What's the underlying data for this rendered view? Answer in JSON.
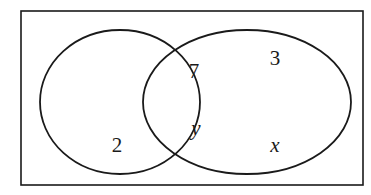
{
  "diagram": {
    "type": "venn-diagram",
    "colors": {
      "background": "#ffffff",
      "stroke": "#1a1a1a",
      "text": "#1a1a1a"
    },
    "universal_set": {
      "shape": "rectangle",
      "x": 21,
      "y": 11,
      "width": 342,
      "height": 174,
      "stroke_width": 1.6
    },
    "sets": [
      {
        "name": "left-set",
        "shape": "ellipse",
        "cx": 120,
        "cy": 102,
        "rx": 80,
        "ry": 72,
        "stroke_width": 1.8
      },
      {
        "name": "right-set",
        "shape": "ellipse",
        "cx": 247,
        "cy": 102,
        "rx": 104,
        "ry": 72,
        "stroke_width": 1.8
      }
    ],
    "intersection_points": [
      {
        "x": 196,
        "y": 38
      },
      {
        "x": 196,
        "y": 168
      }
    ],
    "labels": [
      {
        "id": "intersection-top",
        "text": "7",
        "style": "numeric",
        "region": "intersection",
        "x": 194,
        "y": 71
      },
      {
        "id": "intersection-bottom",
        "text": "y",
        "style": "variable",
        "region": "intersection",
        "x": 196,
        "y": 128
      },
      {
        "id": "right-only-top",
        "text": "3",
        "style": "numeric",
        "region": "right-only",
        "x": 275,
        "y": 58
      },
      {
        "id": "right-only-bottom",
        "text": "x",
        "style": "variable",
        "region": "right-only",
        "x": 275,
        "y": 145
      },
      {
        "id": "left-only",
        "text": "2",
        "style": "numeric",
        "region": "left-only",
        "x": 117,
        "y": 145
      }
    ]
  }
}
